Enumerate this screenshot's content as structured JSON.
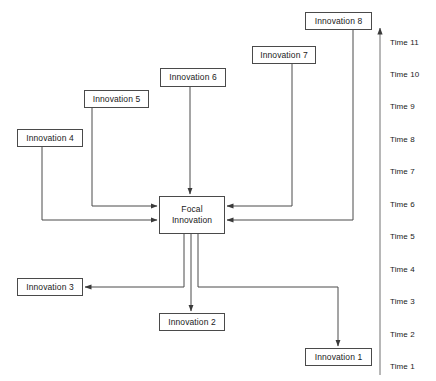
{
  "diagram": {
    "type": "innovation-timeline-flow-diagram",
    "background_color": "#ffffff",
    "line_color": "#4a4a4a",
    "text_color": "#1a1a1a",
    "nodes": [
      {
        "id": "focal",
        "label": "Focal\nInnovation",
        "x": 159,
        "y": 196,
        "w": 66,
        "h": 38
      },
      {
        "id": "innovation-1",
        "label": "Innovation 1",
        "x": 305,
        "y": 348,
        "w": 67,
        "h": 18
      },
      {
        "id": "innovation-2",
        "label": "Innovation 2",
        "x": 159,
        "y": 313,
        "w": 66,
        "h": 18
      },
      {
        "id": "innovation-3",
        "label": "Innovation 3",
        "x": 17,
        "y": 278,
        "w": 66,
        "h": 18
      },
      {
        "id": "innovation-4",
        "label": "Innovation 4",
        "x": 17,
        "y": 129,
        "w": 66,
        "h": 18
      },
      {
        "id": "innovation-5",
        "label": "Innovation 5",
        "x": 84,
        "y": 90,
        "w": 65,
        "h": 18
      },
      {
        "id": "innovation-6",
        "label": "Innovation 6",
        "x": 160,
        "y": 68,
        "w": 66,
        "h": 19
      },
      {
        "id": "innovation-7",
        "label": "Innovation 7",
        "x": 252,
        "y": 46,
        "w": 64,
        "h": 18
      },
      {
        "id": "innovation-8",
        "label": "Innovation 8",
        "x": 305,
        "y": 12,
        "w": 67,
        "h": 18
      }
    ],
    "edges": [
      {
        "id": "edge-innovation-4-to-focal",
        "from": "innovation-4",
        "to": "focal",
        "points": "42,147 42,220 157,220",
        "arrow": "right"
      },
      {
        "id": "edge-innovation-5-to-focal",
        "from": "innovation-5",
        "to": "focal",
        "points": "92,108 92,206 157,206",
        "arrow": "right"
      },
      {
        "id": "edge-innovation-6-to-focal",
        "from": "innovation-6",
        "to": "focal",
        "points": "190,87 190,194",
        "arrow": "down"
      },
      {
        "id": "edge-innovation-7-to-focal",
        "from": "innovation-7",
        "to": "focal",
        "points": "292,64 292,206 227,206",
        "arrow": "left"
      },
      {
        "id": "edge-innovation-8-to-focal",
        "from": "innovation-8",
        "to": "focal",
        "points": "353,30 353,220 227,220",
        "arrow": "left"
      },
      {
        "id": "edge-focal-to-innovation-3",
        "from": "focal",
        "to": "innovation-3",
        "points": "184,234 184,287 85,287",
        "arrow": "left"
      },
      {
        "id": "edge-focal-to-innovation-2",
        "from": "focal",
        "to": "innovation-2",
        "points": "191,234 191,311",
        "arrow": "down"
      },
      {
        "id": "edge-focal-to-innovation-1",
        "from": "focal",
        "to": "innovation-1",
        "points": "198,234 198,287 338,287 338,346",
        "arrow": "down"
      }
    ],
    "time_axis": {
      "name": "time-axis",
      "orientation": "vertical",
      "direction": "upward",
      "axis_x": 380,
      "axis_top_y": 28,
      "axis_bottom_y": 375,
      "labels": [
        {
          "text": "Time 11",
          "y": 43
        },
        {
          "text": "Time 10",
          "y": 75
        },
        {
          "text": "Time 9",
          "y": 107
        },
        {
          "text": "Time 8",
          "y": 140
        },
        {
          "text": "Time 7",
          "y": 172
        },
        {
          "text": "Time 6",
          "y": 205
        },
        {
          "text": "Time 5",
          "y": 237
        },
        {
          "text": "Time 4",
          "y": 270
        },
        {
          "text": "Time 3",
          "y": 302
        },
        {
          "text": "Time 2",
          "y": 335
        },
        {
          "text": "Time 1",
          "y": 367
        }
      ]
    }
  }
}
